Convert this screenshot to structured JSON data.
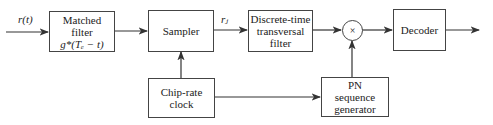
{
  "diagram": {
    "input_label": "r(t)",
    "blocks": {
      "matched_filter": {
        "lines": [
          "Matched",
          "filter",
          "g*(Tₑ − t)"
        ]
      },
      "sampler": {
        "lines": [
          "Sampler"
        ]
      },
      "dt_filter": {
        "lines": [
          "Discrete-time",
          "transversal",
          "filter"
        ]
      },
      "multiplier": {
        "symbol": "×"
      },
      "decoder": {
        "lines": [
          "Decoder"
        ]
      },
      "clock": {
        "lines": [
          "Chip-rate",
          "clock"
        ]
      },
      "pn": {
        "lines": [
          "PN",
          "sequence",
          "generator"
        ]
      }
    },
    "sample_label": "rⱼ",
    "edges": [
      "input -> matched_filter",
      "matched_filter -> sampler",
      "sampler -> dt_filter",
      "dt_filter -> multiplier",
      "multiplier -> decoder",
      "decoder -> output",
      "clock -> sampler",
      "clock -> pn",
      "pn -> multiplier"
    ]
  }
}
